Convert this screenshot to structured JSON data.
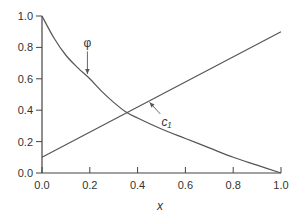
{
  "chart_data": {
    "type": "line",
    "title": "",
    "xlabel": "x",
    "ylabel": "",
    "xlim": [
      0.0,
      1.0
    ],
    "ylim": [
      0.0,
      1.0
    ],
    "grid": false,
    "legend": null,
    "x_ticks": [
      "0.0",
      "0.2",
      "0.4",
      "0.6",
      "0.8",
      "1.0"
    ],
    "y_ticks": [
      "0.0",
      "0.2",
      "0.4",
      "0.6",
      "0.8",
      "1.0"
    ],
    "series": [
      {
        "name": "φ",
        "x": [
          0.0,
          0.05,
          0.1,
          0.15,
          0.2,
          0.25,
          0.3,
          0.35,
          0.4,
          0.5,
          0.6,
          0.7,
          0.8,
          0.9,
          1.0
        ],
        "y": [
          1.0,
          0.86,
          0.75,
          0.67,
          0.6,
          0.52,
          0.45,
          0.39,
          0.35,
          0.28,
          0.22,
          0.16,
          0.1,
          0.05,
          0.0
        ]
      },
      {
        "name": "c₁",
        "x": [
          0.0,
          1.0
        ],
        "y": [
          0.1,
          0.9
        ]
      }
    ],
    "annotations": [
      {
        "text": "φ",
        "series": "φ",
        "label_at": [
          0.19,
          0.8
        ],
        "arrow_to": [
          0.19,
          0.63
        ]
      },
      {
        "text": "c₁",
        "series": "c₁",
        "label_at": [
          0.52,
          0.3
        ],
        "arrow_to": [
          0.45,
          0.45
        ]
      }
    ],
    "colors": {
      "axis": "#444444",
      "line": "#555555",
      "text": "#333333"
    }
  }
}
